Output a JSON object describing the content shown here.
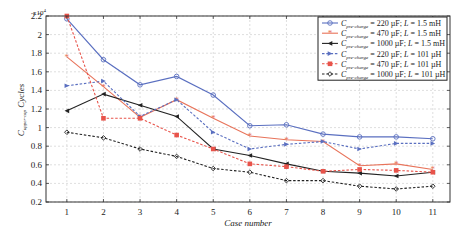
{
  "chart_data": {
    "type": "line",
    "title": "",
    "xlabel": "Case number",
    "ylabel": "C_upper-cap Cycles",
    "ylabel_main": "C",
    "ylabel_sub": "upper-cap",
    "ylabel_tail": " Cycles",
    "y_multiplier": "x10^4",
    "y_multiplier_base": "x10",
    "y_multiplier_exp": "4",
    "xlim": [
      0.43,
      11.47
    ],
    "ylim": [
      0.2,
      2.2
    ],
    "x": [
      1,
      2,
      3,
      4,
      5,
      6,
      7,
      8,
      9,
      10,
      11
    ],
    "x_ticks": [
      "1",
      "2",
      "3",
      "4",
      "5",
      "6",
      "7",
      "8",
      "9",
      "10",
      "11"
    ],
    "y_ticks": [
      "0.2",
      "0.4",
      "0.6",
      "0.8",
      "1",
      "1.2",
      "1.4",
      "1.6",
      "1.8",
      "2",
      "2.2"
    ],
    "grid": true,
    "legend_position": "upper right",
    "series": [
      {
        "name": "C_pre-charge = 220 µF; L = 1.5 mH",
        "cap": "220 µF",
        "ind": "1.5 mH",
        "color": "#5a6fc0",
        "dash": "solid",
        "marker": "circle",
        "values": [
          2.17,
          1.73,
          1.46,
          1.55,
          1.35,
          1.02,
          1.03,
          0.93,
          0.9,
          0.9,
          0.88
        ]
      },
      {
        "name": "C_pre-charge = 470 µF; L = 1.5 mH",
        "cap": "470 µF",
        "ind": "1.5 mH",
        "color": "#e8735a",
        "dash": "solid",
        "marker": "star",
        "values": [
          1.76,
          1.44,
          1.11,
          1.3,
          1.1,
          0.91,
          0.87,
          0.85,
          0.59,
          0.61,
          0.55
        ]
      },
      {
        "name": "C_pre-charge = 1000 µF; L = 1.5 mH",
        "cap": "1000 µF",
        "ind": "1.5 mH",
        "color": "#222222",
        "dash": "solid",
        "marker": "left-triangle",
        "values": [
          1.18,
          1.36,
          1.24,
          1.12,
          0.77,
          0.7,
          0.61,
          0.53,
          0.51,
          0.48,
          0.52
        ]
      },
      {
        "name": "C_pre-charge = 220 µF; L = 101 µH",
        "cap": "220 µF",
        "ind": "101 µH",
        "color": "#5a6fc0",
        "dash": "dashed",
        "marker": "right-triangle",
        "values": [
          1.45,
          1.5,
          1.12,
          1.3,
          0.95,
          0.77,
          0.82,
          0.85,
          0.77,
          0.83,
          0.83
        ]
      },
      {
        "name": "C_pre-charge = 470 µF; L = 101 µH",
        "cap": "470 µF",
        "ind": "101 µH",
        "color": "#e8534a",
        "dash": "dashed",
        "marker": "square",
        "values": [
          2.2,
          1.1,
          1.1,
          0.92,
          0.77,
          0.61,
          0.58,
          0.53,
          0.55,
          0.54,
          0.52
        ]
      },
      {
        "name": "C_pre-charge = 1000 µF; L = 101 µH",
        "cap": "1000 µF",
        "ind": "101 µH",
        "color": "#222222",
        "dash": "dashed",
        "marker": "diamond",
        "values": [
          0.95,
          0.89,
          0.77,
          0.69,
          0.56,
          0.52,
          0.43,
          0.43,
          0.37,
          0.34,
          0.37
        ]
      }
    ]
  },
  "legend": {
    "var_main": "C",
    "var_sub": "pre-charge",
    "ind_var": "L"
  }
}
